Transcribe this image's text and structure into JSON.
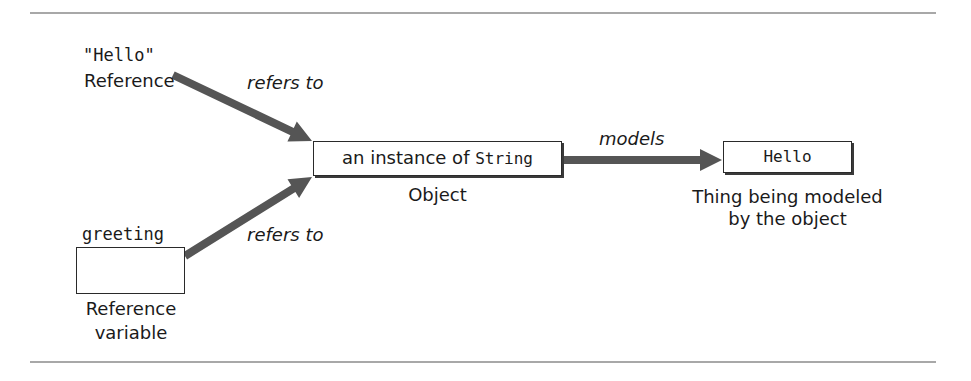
{
  "diagram": {
    "type": "reference-object-model",
    "nodes": {
      "literal_reference": {
        "code": "\"Hello\"",
        "caption": "Reference"
      },
      "reference_variable": {
        "code": "greeting",
        "caption_line1": "Reference",
        "caption_line2": "variable",
        "value": ""
      },
      "object": {
        "text_prefix": "an instance of ",
        "text_code": "String",
        "caption": "Object"
      },
      "modeled_thing": {
        "code": "Hello",
        "caption_line1": "Thing being modeled",
        "caption_line2": "by the object"
      }
    },
    "edges": [
      {
        "from": "literal_reference",
        "to": "object",
        "label": "refers to"
      },
      {
        "from": "reference_variable",
        "to": "object",
        "label": "refers to"
      },
      {
        "from": "object",
        "to": "modeled_thing",
        "label": "models"
      }
    ],
    "colors": {
      "arrow": "#555555",
      "rule": "#a8a8a8",
      "box_border": "#2a2a2a"
    }
  }
}
